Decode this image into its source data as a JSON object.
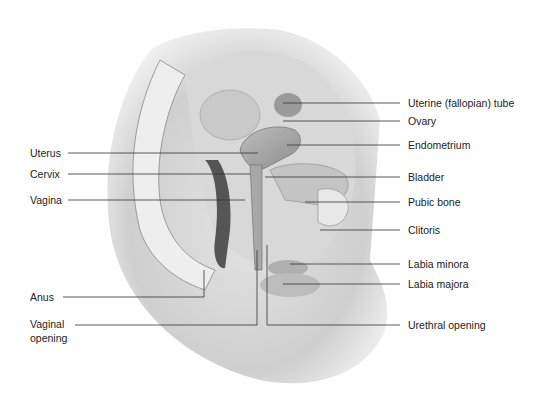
{
  "diagram": {
    "labels_left": [
      {
        "text": "Uterus",
        "x": 30,
        "y": 147
      },
      {
        "text": "Cervix",
        "x": 30,
        "y": 168
      },
      {
        "text": "Vagina",
        "x": 30,
        "y": 194
      },
      {
        "text": "Anus",
        "x": 30,
        "y": 291
      },
      {
        "text": "Vaginal",
        "x": 30,
        "y": 318
      },
      {
        "text": "opening",
        "x": 30,
        "y": 332
      }
    ],
    "labels_right": [
      {
        "text": "Uterine (fallopian) tube",
        "x": 408,
        "y": 99
      },
      {
        "text": "Ovary",
        "x": 408,
        "y": 116
      },
      {
        "text": "Endometrium",
        "x": 408,
        "y": 139
      },
      {
        "text": "Bladder",
        "x": 408,
        "y": 172
      },
      {
        "text": "Pubic bone",
        "x": 408,
        "y": 196
      },
      {
        "text": "Clitoris",
        "x": 408,
        "y": 224
      },
      {
        "text": "Labia minora",
        "x": 408,
        "y": 258
      },
      {
        "text": "Labia majora",
        "x": 408,
        "y": 279
      },
      {
        "text": "Urethral opening",
        "x": 408,
        "y": 320
      }
    ]
  }
}
